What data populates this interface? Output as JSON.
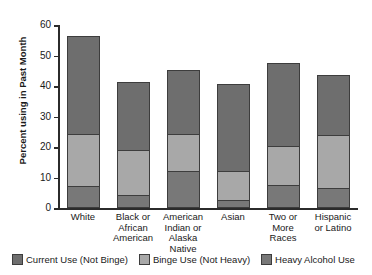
{
  "chart_data": {
    "type": "bar",
    "subtype": "stacked-bar",
    "title": "",
    "xlabel": "",
    "ylabel": "Percent using in Past Month",
    "ylim": [
      0,
      60
    ],
    "yticks": [
      0,
      10,
      20,
      30,
      40,
      50,
      60
    ],
    "ytick_labels": [
      "0",
      "10",
      "20",
      "30",
      "40",
      "50",
      "60"
    ],
    "grid": false,
    "legend_position": "bottom",
    "categories": [
      "White",
      "Black or African American",
      "American Indian or Alaska Native",
      "Asian",
      "Two or More Races",
      "Hispanic or Latino"
    ],
    "category_lines": [
      [
        "White"
      ],
      [
        "Black or",
        "African",
        "American"
      ],
      [
        "American",
        "Indian or",
        "Alaska",
        "Native"
      ],
      [
        "Asian"
      ],
      [
        "Two or",
        "More",
        "Races"
      ],
      [
        "Hispanic",
        "or Latino"
      ]
    ],
    "series": [
      {
        "name": "Heavy Alcohol Use",
        "color": "#787878",
        "stack_order": 0,
        "values": [
          7.3,
          4.4,
          12.3,
          2.5,
          7.4,
          6.5
        ]
      },
      {
        "name": "Binge Use (Not Heavy)",
        "color": "#a8a8a8",
        "stack_order": 1,
        "values": [
          17.0,
          14.5,
          12.0,
          9.5,
          12.9,
          17.5
        ]
      },
      {
        "name": "Current Use (Not Binge)",
        "color": "#6e6e6e",
        "stack_order": 2,
        "values": [
          32.0,
          22.5,
          21.0,
          28.5,
          27.2,
          19.5
        ]
      }
    ],
    "totals": [
      56.3,
      41.4,
      45.3,
      40.5,
      47.5,
      43.5
    ]
  },
  "legend": {
    "items": [
      {
        "label": "Current Use (Not Binge)",
        "color": "#6e6e6e"
      },
      {
        "label": "Binge Use (Not Heavy)",
        "color": "#a8a8a8"
      },
      {
        "label": "Heavy Alcohol Use",
        "color": "#787878"
      }
    ]
  }
}
